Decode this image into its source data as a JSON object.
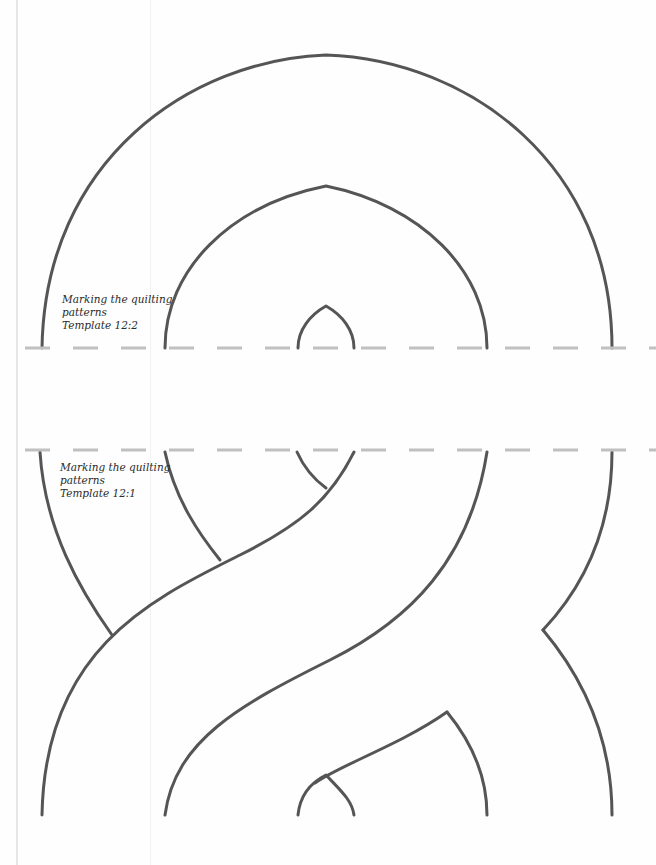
{
  "templates": [
    {
      "id": "12:2",
      "caption_lines": [
        "Marking the quilting",
        "patterns",
        "Template 12:2"
      ]
    },
    {
      "id": "12:1",
      "caption_lines": [
        "Marking the quilting",
        "patterns",
        "Template 12:1"
      ]
    }
  ],
  "colors": {
    "pattern_stroke": "#555555",
    "cut_line": "#c0c0c0",
    "page": "#fefefe"
  },
  "cut_lines": [
    {
      "name": "upper-cut-line",
      "y": 348
    },
    {
      "name": "lower-cut-line",
      "y": 450
    }
  ]
}
